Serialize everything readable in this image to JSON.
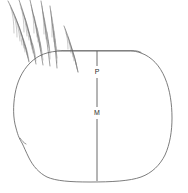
{
  "figure": {
    "background_color": "#ffffff",
    "width": 188,
    "height": 193,
    "outline_color": "#6e6e6e",
    "seta_color": "#4e6e6e",
    "label_color": "#2b2b2b"
  },
  "labels": [
    {
      "text": "P",
      "x": 97,
      "y": 72,
      "name": "label-p"
    },
    {
      "text": "M",
      "x": 97,
      "y": 113,
      "name": "label-m"
    }
  ],
  "measurements": [
    {
      "id": "P",
      "description": "upper vertical measurement segment",
      "x": 97,
      "y_start": 51,
      "y_end": 66
    },
    {
      "id": "P-lower",
      "description": "segment between P and M",
      "x": 97,
      "y_start": 78,
      "y_end": 107
    },
    {
      "id": "M",
      "description": "lower vertical measurement segment",
      "x": 97,
      "y_start": 119,
      "y_end": 180
    }
  ],
  "body_outline": {
    "description": "rounded ovoid egg body with flattened top-left rim, left lateral notch and broad flat base",
    "top_rim_start_x": 62,
    "top_rim_end_x": 140,
    "top_rim_y": 51,
    "base_y": 181,
    "left_notch": {
      "x": 22,
      "y": 143
    }
  },
  "setae": {
    "count": 6,
    "description": "plumose (feather-like) setae radiating from upper-left margin",
    "origin_region": {
      "x": 8,
      "y": 0,
      "width": 88,
      "height": 72
    }
  }
}
